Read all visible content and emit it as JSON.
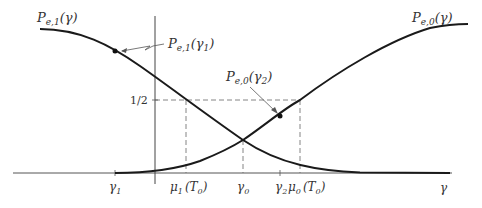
{
  "figure": {
    "type": "diagram",
    "colors": {
      "curve": "#1a1a1a",
      "axis": "#333333",
      "dashed": "#555555",
      "text": "#333333"
    },
    "labels": {
      "pe1_curve": "P",
      "pe1_curve_sub": "e,1",
      "pe1_curve_arg": "(γ)",
      "pe0_curve": "P",
      "pe0_curve_sub": "e,0",
      "pe0_curve_arg": "(γ)",
      "pe1_point": "P",
      "pe1_point_sub": "e,1",
      "pe1_point_arg": "(γ",
      "pe1_point_arg_sub": "1",
      "pe1_point_close": ")",
      "pe0_point": "P",
      "pe0_point_sub": "e,0",
      "pe0_point_arg": "(γ",
      "pe0_point_arg_sub": "2",
      "pe0_point_close": ")",
      "half": "1/2"
    },
    "x_ticks": [
      {
        "main": "γ",
        "sub": "1"
      },
      {
        "main": "μ",
        "sub": "1",
        "arg": "(T",
        "arg_sub": "0",
        "close": ")"
      },
      {
        "main": "γ",
        "sub": "0"
      },
      {
        "main": "γ",
        "sub": "2"
      },
      {
        "main": "μ",
        "sub": "0",
        "arg": "(T",
        "arg_sub": "0",
        "close": ")"
      }
    ],
    "x_axis_label": "γ"
  }
}
